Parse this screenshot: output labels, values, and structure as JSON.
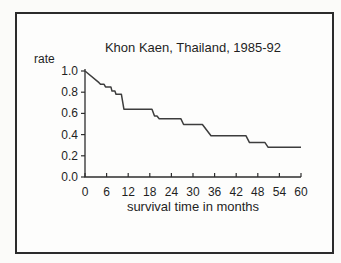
{
  "figure": {
    "title": "Khon Kaen, Thailand, 1985-92",
    "y_axis_label": "rate",
    "x_axis_label": "survival time in months"
  },
  "colors": {
    "curve": "#3d3d3d",
    "axis": "#2e2e2e",
    "text": "#1f1f1f",
    "frame_border": "#2b2b2b",
    "background": "#fdfdfc"
  },
  "chart_data": {
    "type": "line",
    "subtype": "kaplan-meier-step",
    "title": "Khon Kaen, Thailand, 1985-92",
    "xlabel": "survival time in months",
    "ylabel": "rate",
    "xlim": [
      0,
      60
    ],
    "ylim": [
      0.0,
      1.0
    ],
    "x_ticks": [
      0,
      6,
      12,
      18,
      24,
      30,
      36,
      42,
      48,
      54,
      60
    ],
    "y_tick_labels": [
      "1.0",
      "0.8",
      "0.6",
      "0.4",
      "0.2",
      "0.0"
    ],
    "grid": false,
    "legend": "none",
    "series": [
      {
        "name": "survival rate",
        "points": [
          [
            0,
            1.0
          ],
          [
            3.9,
            0.89
          ],
          [
            4.3,
            0.875
          ],
          [
            5.3,
            0.875
          ],
          [
            5.7,
            0.85
          ],
          [
            7.2,
            0.85
          ],
          [
            7.5,
            0.81
          ],
          [
            8.3,
            0.81
          ],
          [
            8.6,
            0.78
          ],
          [
            10.1,
            0.78
          ],
          [
            10.8,
            0.64
          ],
          [
            18.6,
            0.64
          ],
          [
            19.3,
            0.575
          ],
          [
            20.0,
            0.575
          ],
          [
            20.6,
            0.55
          ],
          [
            26.6,
            0.55
          ],
          [
            27.4,
            0.495
          ],
          [
            32.6,
            0.495
          ],
          [
            35.0,
            0.39
          ],
          [
            44.7,
            0.39
          ],
          [
            45.7,
            0.325
          ],
          [
            50.0,
            0.325
          ],
          [
            50.9,
            0.28
          ],
          [
            60,
            0.28
          ]
        ]
      }
    ]
  }
}
